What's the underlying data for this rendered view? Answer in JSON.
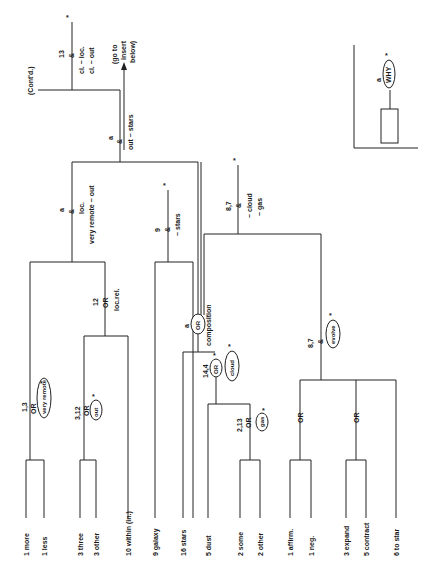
{
  "diagram": {
    "orientation": "rotated 90deg counter-clockwise (text reads bottom-to-top)",
    "continuation": "(Cont'd.)",
    "node13": {
      "id": "13",
      "op": "&",
      "conds": [
        "cl. ~ loc.",
        "cl. ~ out"
      ]
    },
    "goto": [
      "(go to",
      "insert",
      "below)"
    ],
    "nodeA": {
      "id": "a",
      "op": "&",
      "cond": "out ~ stars"
    },
    "nodeLoc": {
      "id": "a",
      "op": "&",
      "conds": [
        "loc.",
        "very remote ~ out"
      ]
    },
    "node12": {
      "id": "12",
      "op": "OR",
      "cond": "loc.rel."
    },
    "node13a": {
      "id": "1,3",
      "op": "OR",
      "ellipse": "very remote"
    },
    "node312": {
      "id": "3,12",
      "op": "OR",
      "ellipse": "out"
    },
    "node9": {
      "id": "9",
      "op": "&",
      "cond": "~ stars"
    },
    "nodeComp": {
      "id": "a",
      "op": "OR",
      "cond": "composition"
    },
    "node144": {
      "id": "14,4",
      "op": "OR",
      "ellipse": "cloud"
    },
    "node213": {
      "id": "2,13",
      "op": "OR",
      "ellipse": "gas"
    },
    "node87top": {
      "id": "8,7",
      "op": "&",
      "conds": [
        "~ cloud",
        "~ gas"
      ]
    },
    "node87": {
      "id": "8,7",
      "op": "&",
      "ellipse": "evolve"
    },
    "or1": "OR",
    "or2": "OR",
    "leaves": [
      "1 more",
      "1 less",
      "3 three",
      "3 other",
      "10 within (in.)",
      "9 galaxy",
      "16 stars",
      "5 dust",
      "2 some",
      "2 other",
      "1 affirm.",
      "1 neg.",
      "3 expand",
      "5 contract",
      "6 to star"
    ],
    "insert": {
      "id": "a",
      "ellipse": "WHY"
    },
    "star": "*"
  }
}
